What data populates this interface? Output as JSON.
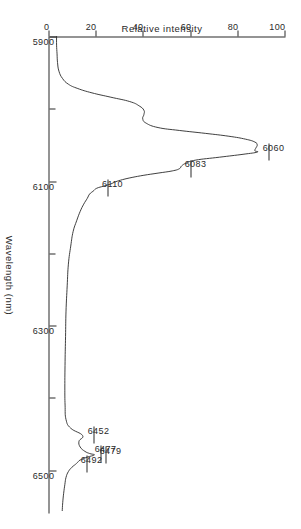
{
  "figure": {
    "kind": "emission-spectrum-plot",
    "background_color": "#ffffff",
    "ink_color": "#2a2a2a",
    "orientation_note": "printed sideways"
  },
  "chart_data": {
    "type": "line",
    "title": "",
    "xlabel": "Wavelength (nm)",
    "ylabel": "Relative intensity",
    "xlim": [
      5900,
      6560
    ],
    "ylim": [
      0,
      100
    ],
    "grid": false,
    "legend": null,
    "x_ticks": [
      {
        "value": 5900,
        "label": "5900",
        "major": true
      },
      {
        "value": 6000,
        "label": "",
        "major": false
      },
      {
        "value": 6100,
        "label": "6100",
        "major": true
      },
      {
        "value": 6200,
        "label": "",
        "major": false
      },
      {
        "value": 6300,
        "label": "6300",
        "major": true
      },
      {
        "value": 6400,
        "label": "",
        "major": false
      },
      {
        "value": 6500,
        "label": "6500",
        "major": true
      }
    ],
    "y_ticks": [
      {
        "value": 0,
        "label": "0"
      },
      {
        "value": 20,
        "label": "20"
      },
      {
        "value": 40,
        "label": "40"
      },
      {
        "value": 60,
        "label": "60"
      },
      {
        "value": 80,
        "label": "80"
      },
      {
        "value": 100,
        "label": "100"
      }
    ],
    "annotations": [
      {
        "label": "6060",
        "wavelength": 6060,
        "intensity": 88
      },
      {
        "label": "6083",
        "wavelength": 6083,
        "intensity": 55
      },
      {
        "label": "6110",
        "wavelength": 6110,
        "intensity": 20
      },
      {
        "label": "6452",
        "wavelength": 6452,
        "intensity": 14
      },
      {
        "label": "6477",
        "wavelength": 6477,
        "intensity": 17
      },
      {
        "label": "6479",
        "wavelength": 6479,
        "intensity": 19
      },
      {
        "label": "6492",
        "wavelength": 6492,
        "intensity": 11
      }
    ],
    "series": [
      {
        "name": "spectrum",
        "x": [
          5900,
          5912,
          5924,
          5936,
          5948,
          5958,
          5966,
          5972,
          5978,
          5984,
          5990,
          5996,
          6002,
          6008,
          6014,
          6020,
          6026,
          6030,
          6034,
          6038,
          6042,
          6046,
          6050,
          6054,
          6058,
          6060,
          6063,
          6067,
          6071,
          6075,
          6079,
          6083,
          6086,
          6089,
          6092,
          6095,
          6098,
          6101,
          6104,
          6107,
          6110,
          6114,
          6118,
          6124,
          6132,
          6142,
          6155,
          6170,
          6190,
          6215,
          6245,
          6280,
          6315,
          6350,
          6385,
          6410,
          6430,
          6442,
          6452,
          6460,
          6468,
          6474,
          6477,
          6479,
          6482,
          6486,
          6489,
          6492,
          6496,
          6502,
          6510,
          6520,
          6532,
          6545,
          6556
        ],
        "y": [
          3,
          3,
          3.2,
          3.4,
          4,
          5.5,
          8,
          12,
          18,
          26,
          34,
          38,
          40,
          40,
          39.5,
          41,
          46,
          55,
          66,
          76,
          83,
          87,
          88,
          87.5,
          87,
          88,
          82,
          72,
          62,
          58,
          56,
          55,
          52,
          46,
          40,
          35,
          31,
          28,
          26,
          23,
          20,
          18.5,
          17,
          16,
          14.5,
          13,
          11.5,
          10,
          9,
          8,
          7.5,
          7,
          6.8,
          6.6,
          6.5,
          6.6,
          7,
          9,
          14,
          12.5,
          13,
          15,
          17,
          19,
          16,
          13,
          12,
          11,
          9.5,
          8,
          7,
          6.5,
          6,
          5.6,
          5.4
        ]
      }
    ]
  },
  "axes": {
    "x_title": "Wavelength (nm)",
    "y_title": "Relative intensity"
  }
}
